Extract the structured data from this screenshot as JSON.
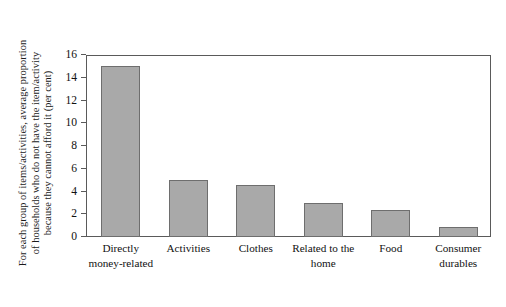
{
  "chart_data": {
    "type": "bar",
    "title": "",
    "xlabel": "",
    "ylabel": "For each group of items/activities, average proportion\nof households who do not have the item/activity\nbecause they cannot afford it (per cent)",
    "categories": [
      "Directly\nmoney-related",
      "Activities",
      "Clothes",
      "Related to the\nhome",
      "Food",
      "Consumer\ndurables"
    ],
    "values": [
      15.0,
      5.0,
      4.6,
      3.0,
      2.4,
      0.9
    ],
    "ylim": [
      0,
      16
    ],
    "yticks": [
      16,
      14,
      12,
      10,
      8,
      6,
      4,
      2,
      0
    ],
    "ytick_labels": [
      "16",
      "14",
      "12",
      "10",
      "8",
      "6",
      "4",
      "2",
      "0"
    ],
    "grid": false,
    "legend": "none",
    "bar_color": "#a9a9a9",
    "bar_edge_color": "#6e6e6e",
    "frame_color": "#5a5a5a",
    "background": "#ffffff"
  }
}
